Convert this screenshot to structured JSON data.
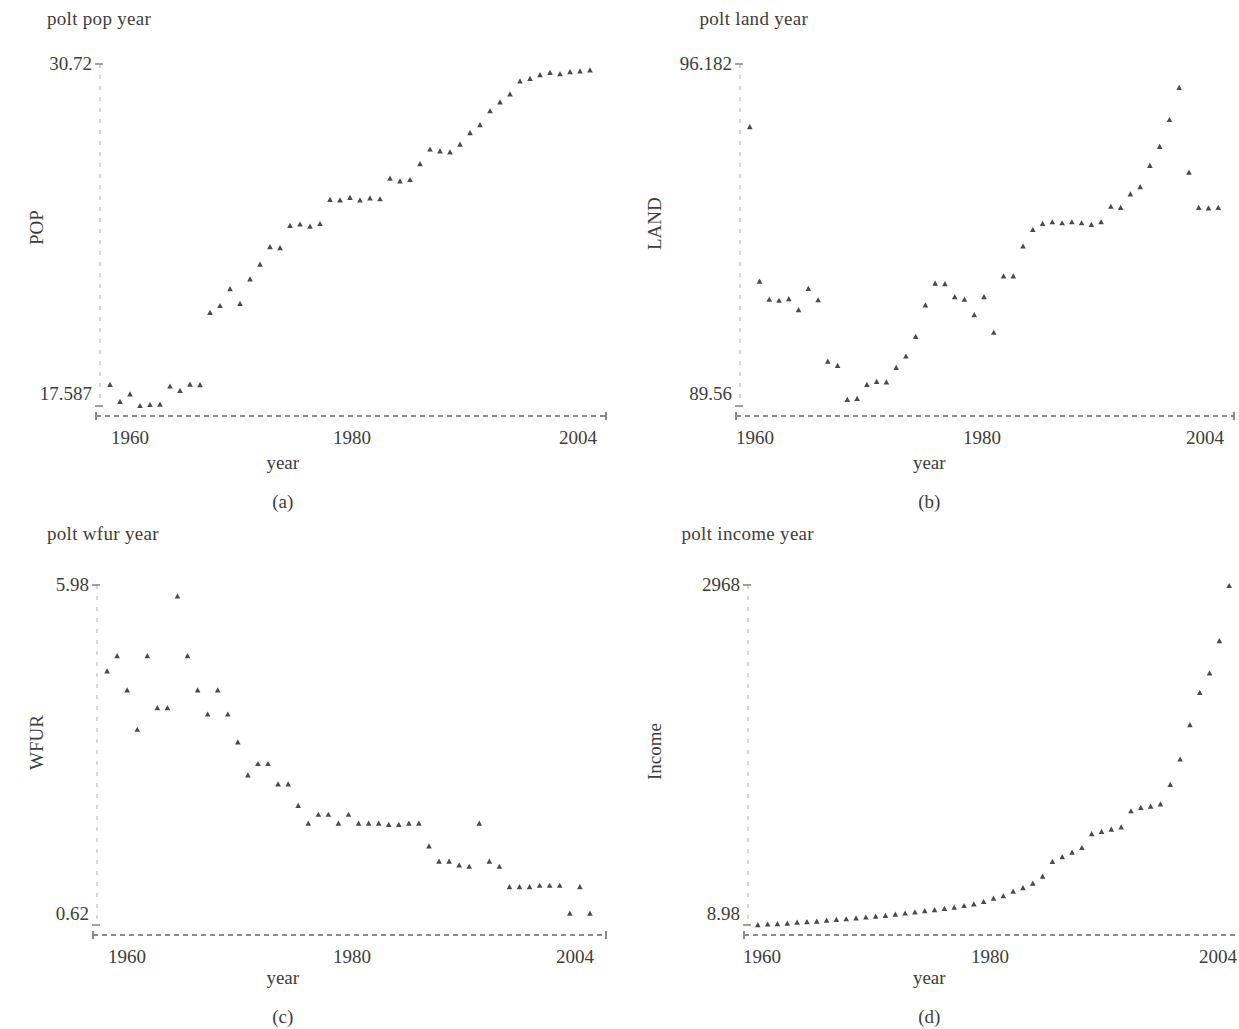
{
  "figure": {
    "panels": [
      {
        "id": "a",
        "title": "polt pop year",
        "caption": "(a)",
        "ylabel": "POP",
        "xlabel": "year",
        "ymin_label": "17.587",
        "ymax_label": "30.72",
        "xticks": [
          "1960",
          "1980",
          "2004"
        ]
      },
      {
        "id": "b",
        "title": "polt land year",
        "caption": "(b)",
        "ylabel": "LAND",
        "xlabel": "year",
        "ymin_label": "89.56",
        "ymax_label": "96.182",
        "xticks": [
          "1960",
          "1980",
          "2004"
        ]
      },
      {
        "id": "c",
        "title": "polt wfur year",
        "caption": "(c)",
        "ylabel": "WFUR",
        "xlabel": "year",
        "ymin_label": "0.62",
        "ymax_label": "5.98",
        "xticks": [
          "1960",
          "1980",
          "2004"
        ]
      },
      {
        "id": "d",
        "title": "polt income year",
        "caption": "(d)",
        "ylabel": "Income",
        "xlabel": "year",
        "ymin_label": "8.98",
        "ymax_label": "2968",
        "xticks": [
          "1960",
          "1980",
          "2004"
        ]
      }
    ],
    "colors": {
      "marker": "#4a4a4a",
      "axis": "#8a8a8a",
      "gridline": "#c8c8c8",
      "text": "#3d3d3d",
      "background": "#ffffff"
    }
  },
  "chart_data": [
    {
      "type": "scatter",
      "panel": "a",
      "title": "polt pop year",
      "xlabel": "year",
      "ylabel": "POP",
      "xlim": [
        1957,
        2007
      ],
      "ylim": [
        17.587,
        30.72
      ],
      "xticks": [
        1960,
        1980,
        2004
      ],
      "yticks": [
        17.587,
        30.72
      ],
      "grid": false,
      "legend": "none",
      "x": [
        1958,
        1959,
        1960,
        1961,
        1962,
        1963,
        1964,
        1965,
        1966,
        1967,
        1968,
        1969,
        1970,
        1971,
        1972,
        1973,
        1974,
        1975,
        1976,
        1977,
        1978,
        1979,
        1980,
        1981,
        1982,
        1983,
        1984,
        1985,
        1986,
        1987,
        1988,
        1989,
        1990,
        1991,
        1992,
        1993,
        1994,
        1995,
        1996,
        1997,
        1998,
        1999,
        2000,
        2001,
        2002,
        2003,
        2004,
        2005,
        2006
      ],
      "y": [
        18.4,
        17.75,
        18.04,
        17.59,
        17.63,
        17.64,
        18.34,
        18.17,
        18.41,
        18.39,
        21.17,
        21.43,
        22.08,
        21.51,
        22.45,
        23.02,
        23.69,
        23.65,
        24.51,
        24.56,
        24.48,
        24.58,
        25.51,
        25.49,
        25.58,
        25.49,
        25.56,
        25.53,
        26.32,
        26.22,
        26.27,
        26.88,
        27.44,
        27.37,
        27.33,
        27.63,
        28.07,
        28.38,
        28.91,
        29.25,
        29.56,
        30.06,
        30.15,
        30.3,
        30.38,
        30.33,
        30.41,
        30.44,
        30.48
      ]
    },
    {
      "type": "scatter",
      "panel": "b",
      "title": "polt land year",
      "xlabel": "year",
      "ylabel": "LAND",
      "xlim": [
        1957,
        2007
      ],
      "ylim": [
        89.56,
        96.182
      ],
      "xticks": [
        1960,
        1980,
        2004
      ],
      "yticks": [
        89.56,
        96.182
      ],
      "grid": false,
      "legend": "none",
      "x": [
        1958,
        1959,
        1960,
        1961,
        1962,
        1963,
        1964,
        1965,
        1966,
        1967,
        1968,
        1969,
        1970,
        1971,
        1972,
        1973,
        1974,
        1975,
        1976,
        1977,
        1978,
        1979,
        1980,
        1981,
        1982,
        1983,
        1984,
        1985,
        1986,
        1987,
        1988,
        1989,
        1990,
        1991,
        1992,
        1993,
        1994,
        1995,
        1996,
        1997,
        1998,
        1999,
        2000,
        2001,
        2002,
        2003,
        2004,
        2005,
        2006
      ],
      "y": [
        94.96,
        91.97,
        91.62,
        91.6,
        91.63,
        91.42,
        91.83,
        91.61,
        90.42,
        90.34,
        89.68,
        89.7,
        89.97,
        90.03,
        90.02,
        90.3,
        90.52,
        90.9,
        91.51,
        91.93,
        91.92,
        91.67,
        91.62,
        91.32,
        91.67,
        90.98,
        92.07,
        92.07,
        92.65,
        92.97,
        93.09,
        93.12,
        93.1,
        93.12,
        93.1,
        93.07,
        93.12,
        93.42,
        93.4,
        93.66,
        93.8,
        94.21,
        94.58,
        95.1,
        95.72,
        94.08,
        93.4,
        93.39,
        93.4
      ]
    },
    {
      "type": "scatter",
      "panel": "c",
      "title": "polt wfur year",
      "xlabel": "year",
      "ylabel": "WFUR",
      "xlim": [
        1957,
        2007
      ],
      "ylim": [
        0.62,
        5.98
      ],
      "xticks": [
        1960,
        1980,
        2004
      ],
      "yticks": [
        0.62,
        5.98
      ],
      "grid": false,
      "legend": "none",
      "x": [
        1958,
        1959,
        1960,
        1961,
        1962,
        1963,
        1964,
        1965,
        1966,
        1967,
        1968,
        1969,
        1970,
        1971,
        1972,
        1973,
        1974,
        1975,
        1976,
        1977,
        1978,
        1979,
        1980,
        1981,
        1982,
        1983,
        1984,
        1985,
        1986,
        1987,
        1988,
        1989,
        1990,
        1991,
        1992,
        1993,
        1994,
        1995,
        1996,
        1997,
        1998,
        1999,
        2000,
        2001,
        2002,
        2003,
        2004,
        2005,
        2006
      ],
      "y": [
        4.62,
        4.86,
        4.32,
        3.7,
        4.86,
        4.04,
        4.04,
        5.8,
        4.86,
        4.32,
        3.94,
        4.32,
        3.94,
        3.5,
        2.98,
        3.16,
        3.16,
        2.84,
        2.84,
        2.5,
        2.22,
        2.36,
        2.36,
        2.22,
        2.36,
        2.22,
        2.22,
        2.22,
        2.2,
        2.2,
        2.22,
        2.22,
        1.86,
        1.62,
        1.62,
        1.56,
        1.54,
        2.22,
        1.62,
        1.54,
        1.22,
        1.22,
        1.22,
        1.24,
        1.24,
        1.24,
        0.8,
        1.22,
        0.8
      ]
    },
    {
      "type": "scatter",
      "panel": "d",
      "title": "polt income year",
      "xlabel": "year",
      "ylabel": "Income",
      "xlim": [
        1957,
        2007
      ],
      "ylim": [
        8.98,
        2968
      ],
      "xticks": [
        1960,
        1980,
        2004
      ],
      "yticks": [
        8.98,
        2968
      ],
      "grid": false,
      "legend": "none",
      "x": [
        1958,
        1959,
        1960,
        1961,
        1962,
        1963,
        1964,
        1965,
        1966,
        1967,
        1968,
        1969,
        1970,
        1971,
        1972,
        1973,
        1974,
        1975,
        1976,
        1977,
        1978,
        1979,
        1980,
        1981,
        1982,
        1983,
        1984,
        1985,
        1986,
        1987,
        1988,
        1989,
        1990,
        1991,
        1992,
        1993,
        1994,
        1995,
        1996,
        1997,
        1998,
        1999,
        2000,
        2001,
        2002,
        2003,
        2004,
        2005,
        2006
      ],
      "y": [
        8.98,
        14,
        18,
        22,
        30,
        35,
        40,
        48,
        55,
        60,
        68,
        75,
        82,
        90,
        100,
        110,
        120,
        130,
        140,
        150,
        160,
        175,
        190,
        210,
        240,
        260,
        300,
        330,
        370,
        430,
        560,
        600,
        640,
        680,
        800,
        820,
        840,
        860,
        1000,
        1030,
        1040,
        1060,
        1230,
        1450,
        1750,
        2030,
        2200,
        2480,
        2960
      ]
    }
  ]
}
